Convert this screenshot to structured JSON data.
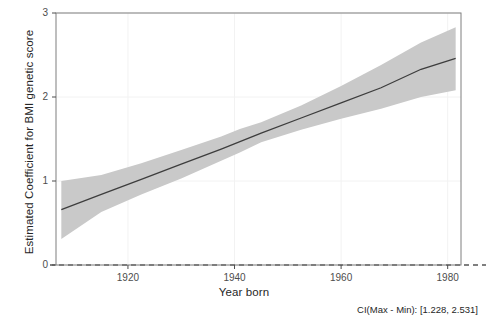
{
  "chart_data": {
    "type": "line",
    "title": "",
    "subtitle": "",
    "xlabel": "Year born",
    "ylabel": "Estimated Coefficient for BMI genetic score",
    "xlim": [
      1906.5,
      1982.5
    ],
    "ylim": [
      0,
      3
    ],
    "xticks": [
      1920,
      1940,
      1960,
      1980
    ],
    "xtick_labels": [
      "1920",
      "1940",
      "1960",
      "1980"
    ],
    "yticks": [
      0,
      1,
      2,
      3
    ],
    "ytick_labels": [
      "0",
      "1",
      "2",
      "3"
    ],
    "grid": true,
    "legend": "none",
    "annotations": [
      {
        "name": "ci-range-note",
        "text": "CI(Max - Min): [1.228, 2.531]",
        "position": "bottom-right"
      }
    ],
    "reference_lines": [
      {
        "name": "zero-line",
        "orientation": "horizontal",
        "y": 0,
        "style": "dashed",
        "color": "#000000"
      }
    ],
    "series": [
      {
        "name": "Estimated coefficient (fit)",
        "type": "line",
        "color": "#3d3d3d",
        "x": [
          1907.5,
          1915,
          1922.5,
          1930,
          1937.5,
          1945,
          1952.5,
          1960,
          1967.5,
          1975,
          1981.5
        ],
        "y": [
          0.66,
          0.84,
          1.02,
          1.2,
          1.38,
          1.57,
          1.75,
          1.93,
          2.11,
          2.33,
          2.46
        ]
      },
      {
        "name": "95% confidence interval",
        "type": "band",
        "color": "#c9c9c9",
        "x": [
          1907.5,
          1915,
          1922.5,
          1930,
          1937.5,
          1941,
          1945,
          1952.5,
          1960,
          1967.5,
          1975,
          1981.5
        ],
        "lower": [
          0.31,
          0.63,
          0.84,
          1.03,
          1.24,
          1.34,
          1.46,
          1.61,
          1.74,
          1.86,
          2.0,
          2.08
        ],
        "upper": [
          1.0,
          1.07,
          1.21,
          1.37,
          1.53,
          1.62,
          1.7,
          1.9,
          2.13,
          2.38,
          2.65,
          2.83
        ]
      }
    ],
    "colors": {
      "line": "#3d3d3d",
      "band": "#c9c9c9",
      "grid": "#f2f2f2",
      "panel_border": "#7f7f7f",
      "zero_line": "#000000",
      "background": "#ffffff"
    }
  }
}
